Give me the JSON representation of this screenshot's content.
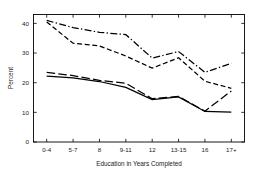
{
  "chart_data": {
    "type": "line",
    "title": "",
    "xlabel": "Education in Years Completed",
    "ylabel": "Percent",
    "categories": [
      "0-4",
      "5-7",
      "8",
      "9-11",
      "12",
      "13-15",
      "16",
      "17+"
    ],
    "xtick_labels": [
      "0-4",
      "5-7",
      "8",
      "9-11",
      "12",
      "13-15",
      "16",
      "17+"
    ],
    "ytick_labels": [
      "0",
      "10",
      "20",
      "30",
      "40"
    ],
    "ytick_values": [
      0,
      10,
      20,
      30,
      40
    ],
    "ylim": [
      0,
      43
    ],
    "xlim": [
      -0.5,
      7.5
    ],
    "grid": false,
    "legend": "none",
    "box": true,
    "series": [
      {
        "name": "series-1-dash-dot",
        "style": "dash-dot",
        "values": [
          41.0,
          38.6,
          37.0,
          36.2,
          28.3,
          30.5,
          23.5,
          26.5
        ]
      },
      {
        "name": "series-2-dashed",
        "style": "dashed",
        "values": [
          40.5,
          33.3,
          32.4,
          29.0,
          24.9,
          28.4,
          20.5,
          18.1
        ]
      },
      {
        "name": "series-3-long-dash",
        "style": "long-dash",
        "values": [
          23.5,
          22.4,
          20.8,
          19.8,
          14.6,
          15.4,
          10.4,
          17.2
        ]
      },
      {
        "name": "series-4-solid",
        "style": "solid",
        "values": [
          22.2,
          21.6,
          20.4,
          18.4,
          14.3,
          15.2,
          10.3,
          10.1
        ]
      }
    ]
  },
  "axes": {
    "ylabel": "Percent",
    "xlabel": "Education in Years Completed"
  }
}
